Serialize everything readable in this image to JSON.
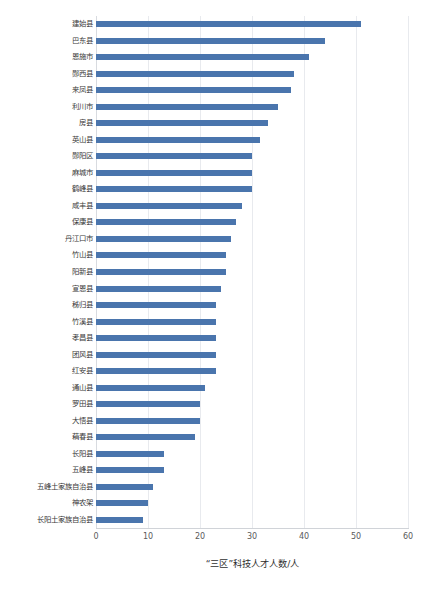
{
  "chart_data": {
    "type": "bar",
    "orientation": "horizontal",
    "title": "",
    "subtitle": "",
    "xlabel": "“三区”科技人才人数/人",
    "ylabel": "",
    "xlim": [
      0,
      60
    ],
    "xticks": [
      "0",
      "10",
      "20",
      "30",
      "40",
      "50",
      "60"
    ],
    "xtick_values": [
      0,
      10,
      20,
      30,
      40,
      50,
      60
    ],
    "grid": true,
    "grid_axis": "x",
    "legend": false,
    "legend_position": "none",
    "bar_color": "#4a75ad",
    "grid_color": "#e8eaee",
    "categories": [
      "建始县",
      "巴东县",
      "恩施市",
      "郧西县",
      "来凤县",
      "利川市",
      "房县",
      "英山县",
      "郧阳区",
      "麻城市",
      "鹤峰县",
      "咸丰县",
      "保康县",
      "丹江口市",
      "竹山县",
      "阳新县",
      "宣恩县",
      "秭归县",
      "竹溪县",
      "孝昌县",
      "团风县",
      "红安县",
      "通山县",
      "罗田县",
      "大悟县",
      "蕱春县",
      "长阳县",
      "五峰县",
      "五峰土家族自治县",
      "神农架",
      "长阳土家族自治县"
    ],
    "values": [
      51,
      44,
      41,
      38,
      37.5,
      35,
      33,
      31.5,
      30,
      30,
      30,
      28,
      27,
      26,
      25,
      25,
      24,
      23,
      23,
      23,
      23,
      23,
      21,
      20,
      20,
      19,
      13,
      13,
      11,
      10,
      9
    ],
    "data": [
      {
        "category": "建始县",
        "value": 51
      },
      {
        "category": "巴东县",
        "value": 44
      },
      {
        "category": "恩施市",
        "value": 41
      },
      {
        "category": "郧西县",
        "value": 38
      },
      {
        "category": "来凤县",
        "value": 37.5
      },
      {
        "category": "利川市",
        "value": 35
      },
      {
        "category": "房县",
        "value": 33
      },
      {
        "category": "英山县",
        "value": 31.5
      },
      {
        "category": "郧阳区",
        "value": 30
      },
      {
        "category": "麻城市",
        "value": 30
      },
      {
        "category": "鹤峰县",
        "value": 30
      },
      {
        "category": "咸丰县",
        "value": 28
      },
      {
        "category": "保康县",
        "value": 27
      },
      {
        "category": "丹江口市",
        "value": 26
      },
      {
        "category": "竹山县",
        "value": 25
      },
      {
        "category": "阳新县",
        "value": 25
      },
      {
        "category": "宣恩县",
        "value": 24
      },
      {
        "category": "秭归县",
        "value": 23
      },
      {
        "category": "竹溪县",
        "value": 23
      },
      {
        "category": "孝昌县",
        "value": 23
      },
      {
        "category": "团风县",
        "value": 23
      },
      {
        "category": "红安县",
        "value": 23
      },
      {
        "category": "通山县",
        "value": 21
      },
      {
        "category": "罗田县",
        "value": 20
      },
      {
        "category": "大悟县",
        "value": 20
      },
      {
        "category": "蕱春县",
        "value": 19
      },
      {
        "category": "长阳县",
        "value": 13
      },
      {
        "category": "五峰县",
        "value": 13
      },
      {
        "category": "五峰土家族自治县",
        "value": 11
      },
      {
        "category": "神农架",
        "value": 10
      },
      {
        "category": "长阳土家族自治县",
        "value": 9
      }
    ]
  }
}
